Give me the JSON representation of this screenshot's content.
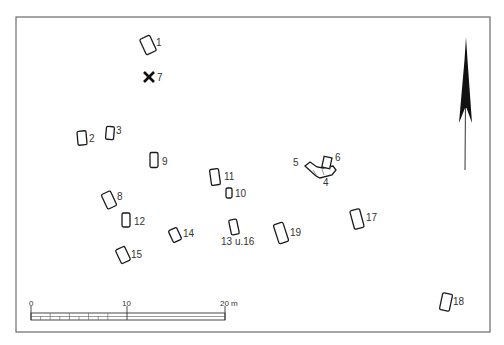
{
  "figure": {
    "type": "grave-distribution-plan",
    "frame": {
      "x": 16,
      "y": 17,
      "w": 474,
      "h": 315
    }
  },
  "graves": [
    {
      "id": "1",
      "label": "1",
      "cx": 148,
      "cy": 45,
      "w": 11,
      "h": 17,
      "rot": -25,
      "lx": 156,
      "ly": 46
    },
    {
      "id": "2",
      "label": "2",
      "cx": 82,
      "cy": 138,
      "w": 9,
      "h": 14,
      "rot": -5,
      "lx": 89,
      "ly": 142
    },
    {
      "id": "3",
      "label": "3",
      "cx": 110,
      "cy": 133,
      "w": 8,
      "h": 13,
      "rot": 5,
      "lx": 116,
      "ly": 134
    },
    {
      "id": "8",
      "label": "8",
      "cx": 109,
      "cy": 200,
      "w": 10,
      "h": 16,
      "rot": -25,
      "lx": 117,
      "ly": 200
    },
    {
      "id": "9",
      "label": "9",
      "cx": 154,
      "cy": 160,
      "w": 8,
      "h": 15,
      "rot": 0,
      "lx": 162,
      "ly": 165
    },
    {
      "id": "10",
      "label": "10",
      "cx": 229,
      "cy": 193,
      "w": 6,
      "h": 10,
      "rot": 0,
      "lx": 235,
      "ly": 197
    },
    {
      "id": "11",
      "label": "11",
      "cx": 215,
      "cy": 177,
      "w": 9,
      "h": 16,
      "rot": -8,
      "lx": 224,
      "ly": 180
    },
    {
      "id": "12",
      "label": "12",
      "cx": 126,
      "cy": 220,
      "w": 8,
      "h": 14,
      "rot": 0,
      "lx": 134,
      "ly": 225
    },
    {
      "id": "13u16",
      "label": "13 u.16",
      "cx": 234,
      "cy": 227,
      "w": 8,
      "h": 15,
      "rot": -12,
      "lx": 221,
      "ly": 245
    },
    {
      "id": "14",
      "label": "14",
      "cx": 175,
      "cy": 235,
      "w": 9,
      "h": 13,
      "rot": -25,
      "lx": 183,
      "ly": 237
    },
    {
      "id": "15",
      "label": "15",
      "cx": 123,
      "cy": 255,
      "w": 10,
      "h": 15,
      "rot": -25,
      "lx": 131,
      "ly": 258
    },
    {
      "id": "17",
      "label": "17",
      "cx": 357,
      "cy": 219,
      "w": 10,
      "h": 19,
      "rot": -15,
      "lx": 366,
      "ly": 221
    },
    {
      "id": "18",
      "label": "18",
      "cx": 446,
      "cy": 302,
      "w": 10,
      "h": 17,
      "rot": 12,
      "lx": 453,
      "ly": 305
    },
    {
      "id": "19",
      "label": "19",
      "cx": 281,
      "cy": 233,
      "w": 10,
      "h": 20,
      "rot": -18,
      "lx": 290,
      "ly": 236
    }
  ],
  "grave_cluster": {
    "labels": [
      {
        "text": "5",
        "x": 293,
        "y": 166
      },
      {
        "text": "6",
        "x": 335,
        "y": 161
      },
      {
        "text": "4",
        "x": 323,
        "y": 186
      }
    ]
  },
  "marker_x": {
    "label": "7",
    "x": 149,
    "y": 77,
    "lx": 157,
    "ly": 81
  },
  "scale_bar": {
    "x0": 31,
    "x10": 127,
    "x20": 225,
    "y": 313,
    "h": 7,
    "labels": {
      "zero": "0",
      "ten": "10",
      "twenty": "20 m"
    }
  },
  "north_arrow": {
    "tip_x": 466,
    "tip_y": 37,
    "base_y": 170
  }
}
